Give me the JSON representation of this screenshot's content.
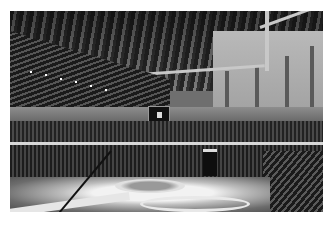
{
  "image": {
    "description": "Black-and-white photograph of an indoor arena interior with tiered seating, a central scoreboard, a lit circular stage on the floor and a ribbed roof structure",
    "colors": {
      "background": "#ffffff",
      "roof_dark": "#2a2a2a",
      "wall": "#b9b9b9",
      "floor_light": "#f2f2f2",
      "seats": "#222222"
    }
  }
}
